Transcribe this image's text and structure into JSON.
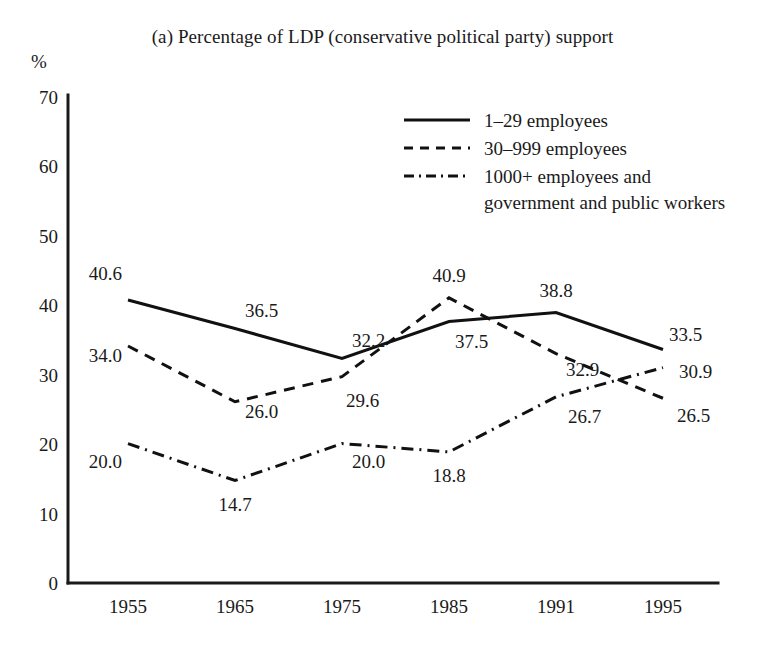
{
  "figure": {
    "title": "(a) Percentage of LDP (conservative political party) support",
    "y_axis_unit_label": "%"
  },
  "chart_data": {
    "type": "line",
    "title": "(a) Percentage of LDP (conservative political party) support",
    "xlabel": "",
    "ylabel": "%",
    "ylim": [
      0,
      70
    ],
    "yticks": [
      0,
      10,
      20,
      30,
      40,
      50,
      60,
      70
    ],
    "grid": false,
    "legend_position": "top-center-right",
    "categories": [
      "1955",
      "1965",
      "1975",
      "1985",
      "1991",
      "1995"
    ],
    "series": [
      {
        "name": "1–29 employees",
        "style": "solid",
        "values": [
          40.6,
          36.5,
          32.2,
          37.5,
          38.8,
          33.5
        ],
        "labels": [
          "40.6",
          "36.5",
          "32.2",
          "37.5",
          "38.8",
          "33.5"
        ]
      },
      {
        "name": "30–999 employees",
        "style": "dashed",
        "values": [
          34.0,
          26.0,
          29.6,
          40.9,
          32.9,
          26.5
        ],
        "labels": [
          "34.0",
          "26.0",
          "29.6",
          "40.9",
          "32.9",
          "26.5"
        ]
      },
      {
        "name": "1000+ employees and government and public workers",
        "style": "dash-dot",
        "values": [
          20.0,
          14.7,
          20.0,
          18.8,
          26.7,
          30.9
        ],
        "labels": [
          "20.0",
          "14.7",
          "20.0",
          "18.8",
          "26.7",
          "30.9"
        ]
      }
    ]
  },
  "legend": {
    "entries": [
      {
        "label": "1–29 employees",
        "label2": "",
        "style": "solid"
      },
      {
        "label": "30–999 employees",
        "label2": "",
        "style": "dashed"
      },
      {
        "label": "1000+ employees and",
        "label2": "government and public workers",
        "style": "dash-dot"
      }
    ]
  },
  "axes": {
    "y_ticks": [
      "70",
      "60",
      "50",
      "40",
      "30",
      "20",
      "10",
      "0"
    ],
    "x_ticks": [
      "1955",
      "1965",
      "1975",
      "1985",
      "1991",
      "1995"
    ]
  },
  "point_labels": {
    "s1": [
      "40.6",
      "36.5",
      "32.2",
      "37.5",
      "38.8",
      "33.5"
    ],
    "s2": [
      "34.0",
      "26.0",
      "29.6",
      "40.9",
      "32.9",
      "26.5"
    ],
    "s3": [
      "20.0",
      "14.7",
      "20.0",
      "18.8",
      "26.7",
      "30.9"
    ]
  }
}
